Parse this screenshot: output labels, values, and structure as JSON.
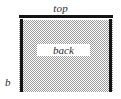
{
  "diagram": {
    "background_color": "#ffffff",
    "member_color": "#141414",
    "hatch_color": "#9a9a9a",
    "labels": {
      "top": "top",
      "back": "back",
      "side": "b"
    }
  }
}
